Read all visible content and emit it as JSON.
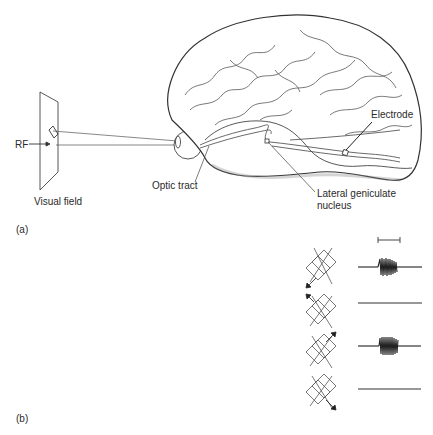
{
  "panel_a": {
    "label": "(a)",
    "rf_label": "RF",
    "visual_field_label": "Visual field",
    "optic_tract_label": "Optic tract",
    "lgn_label_line1": "Lateral geniculate",
    "lgn_label_line2": "nucleus",
    "electrode_label": "Electrode"
  },
  "panel_b": {
    "label": "(b)",
    "rows": [
      {
        "direction": "down-left",
        "response": "burst"
      },
      {
        "direction": "up-left",
        "response": "none"
      },
      {
        "direction": "up-right",
        "response": "burst"
      },
      {
        "direction": "down-right",
        "response": "none"
      }
    ]
  }
}
